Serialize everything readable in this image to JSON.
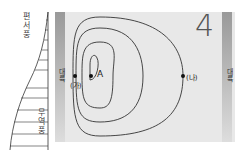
{
  "wind": {
    "top_label": "편서풍",
    "bottom_label": "무역풍"
  },
  "continents": {
    "left_label": "대륙",
    "right_label": "대륙"
  },
  "points": {
    "a": "A",
    "ga": "(가)",
    "na": "(나)"
  },
  "panel_number": "4"
}
